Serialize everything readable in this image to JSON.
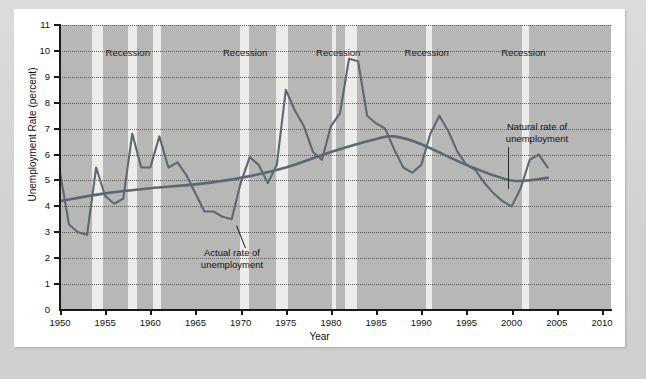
{
  "figure": {
    "background_color": "#b7b7b5",
    "band_color": "#ececea",
    "line_color": "#5d6871",
    "axis_label_x": "Year",
    "axis_label_y": "Unemployment Rate (percent)"
  },
  "annotations": [
    {
      "name": "actual-rate",
      "line1": "Actual rate of",
      "line2": "unemployment"
    },
    {
      "name": "natural-rate",
      "line1": "Natural rate of",
      "line2": "unemployment"
    }
  ],
  "recession_labels": [
    "Recession",
    "Recession",
    "Recession",
    "Recession",
    "Recession"
  ],
  "chart_data": {
    "type": "line",
    "title": "",
    "xlabel": "Year",
    "ylabel": "Unemployment Rate (percent)",
    "xlim": [
      1950,
      2011
    ],
    "ylim": [
      0,
      11
    ],
    "xticks": [
      1950,
      1955,
      1960,
      1965,
      1970,
      1975,
      1980,
      1985,
      1990,
      1995,
      2000,
      2005,
      2010
    ],
    "yticks": [
      0,
      1,
      2,
      3,
      4,
      5,
      6,
      7,
      8,
      9,
      10,
      11
    ],
    "grid": "horizontal-dotted",
    "legend": "annotated-inline",
    "recession_bands": [
      {
        "label": "Recession",
        "start": 1953.5,
        "end": 1954.8,
        "label_x": 1957.5
      },
      {
        "label": "Recession",
        "start": 1957.5,
        "end": 1958.5,
        "label_x": 1957.5
      },
      {
        "label": "Recession",
        "start": 1960.3,
        "end": 1961.2,
        "label_x": 1957.5
      },
      {
        "label": "Recession",
        "start": 1969.9,
        "end": 1970.9,
        "label_x": 1970.5
      },
      {
        "label": "Recession",
        "start": 1973.9,
        "end": 1975.2,
        "label_x": 1970.5
      },
      {
        "label": "Recession",
        "start": 1980.1,
        "end": 1980.6,
        "label_x": 1980.8
      },
      {
        "label": "Recession",
        "start": 1981.5,
        "end": 1982.9,
        "label_x": 1980.8
      },
      {
        "label": "Recession",
        "start": 1990.5,
        "end": 1991.2,
        "label_x": 1990.6
      },
      {
        "label": "Recession",
        "start": 2001.1,
        "end": 2001.9,
        "label_x": 2001.3
      }
    ],
    "series": [
      {
        "name": "Actual rate of unemployment",
        "color": "#5d6871",
        "x": [
          1950,
          1951,
          1952,
          1953,
          1954,
          1955,
          1956,
          1957,
          1958,
          1959,
          1960,
          1961,
          1962,
          1963,
          1964,
          1965,
          1966,
          1967,
          1968,
          1969,
          1970,
          1971,
          1972,
          1973,
          1974,
          1975,
          1976,
          1977,
          1978,
          1979,
          1980,
          1981,
          1982,
          1983,
          1984,
          1985,
          1986,
          1987,
          1988,
          1989,
          1990,
          1991,
          1992,
          1993,
          1994,
          1995,
          1996,
          1997,
          1998,
          1999,
          2000,
          2001,
          2002,
          2003,
          2004
        ],
        "values": [
          5.3,
          3.3,
          3.0,
          2.9,
          5.5,
          4.4,
          4.1,
          4.3,
          6.8,
          5.5,
          5.5,
          6.7,
          5.5,
          5.7,
          5.2,
          4.5,
          3.8,
          3.8,
          3.6,
          3.5,
          4.9,
          5.9,
          5.6,
          4.9,
          5.6,
          8.5,
          7.7,
          7.1,
          6.1,
          5.8,
          7.1,
          7.6,
          9.7,
          9.6,
          7.5,
          7.2,
          7.0,
          6.2,
          5.5,
          5.3,
          5.6,
          6.8,
          7.5,
          6.9,
          6.1,
          5.6,
          5.4,
          4.9,
          4.5,
          4.2,
          4.0,
          4.7,
          5.8,
          6.0,
          5.5
        ],
        "description": "Jagged annual civilian unemployment rate"
      },
      {
        "name": "Natural rate of unemployment",
        "color": "#5d6871",
        "x": [
          1950,
          1955,
          1960,
          1965,
          1970,
          1975,
          1980,
          1985,
          1987,
          1990,
          1995,
          2000,
          2004
        ],
        "values": [
          4.2,
          4.5,
          4.7,
          4.85,
          5.1,
          5.5,
          6.1,
          6.6,
          6.7,
          6.4,
          5.6,
          5.0,
          5.1
        ],
        "description": "Smooth slowly-varying natural rate curve"
      }
    ]
  }
}
